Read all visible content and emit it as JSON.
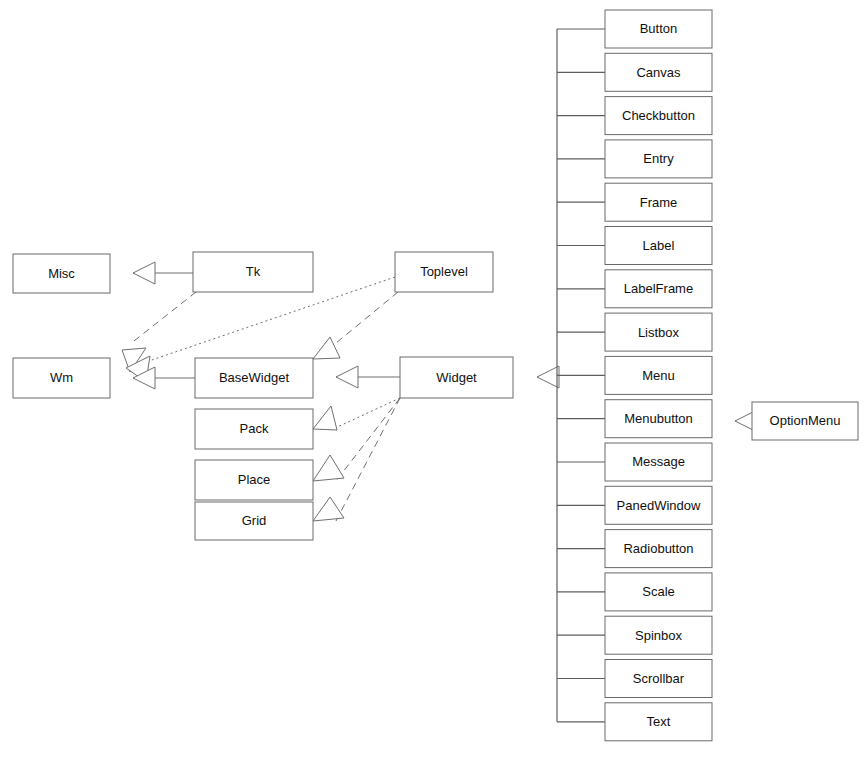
{
  "diagram": {
    "type": "uml-class-diagram",
    "background_color": "#ffffff",
    "box_fill": "#ffffff",
    "box_stroke": "#6a6a6a",
    "line_color": "#6f6f6f",
    "text_color": "#101010"
  },
  "classes": [
    {
      "id": "misc",
      "label": "Misc",
      "x": 13,
      "y": 254,
      "w": 97,
      "h": 39
    },
    {
      "id": "tk",
      "label": "Tk",
      "x": 193,
      "y": 252,
      "w": 120,
      "h": 40
    },
    {
      "id": "toplevel",
      "label": "Toplevel",
      "x": 395,
      "y": 252,
      "w": 98,
      "h": 40
    },
    {
      "id": "wm",
      "label": "Wm",
      "x": 13,
      "y": 358,
      "w": 97,
      "h": 40
    },
    {
      "id": "basewidget",
      "label": "BaseWidget",
      "x": 195,
      "y": 358,
      "w": 118,
      "h": 40
    },
    {
      "id": "widget",
      "label": "Widget",
      "x": 400,
      "y": 357,
      "w": 113,
      "h": 41
    },
    {
      "id": "pack",
      "label": "Pack",
      "x": 195,
      "y": 409,
      "w": 118,
      "h": 40
    },
    {
      "id": "place",
      "label": "Place",
      "x": 195,
      "y": 460,
      "w": 118,
      "h": 40
    },
    {
      "id": "grid",
      "label": "Grid",
      "x": 195,
      "y": 502,
      "w": 118,
      "h": 38
    },
    {
      "id": "optionmenu",
      "label": "OptionMenu",
      "x": 752,
      "y": 402,
      "w": 106,
      "h": 38
    }
  ],
  "widget_column": {
    "x": 605,
    "w": 107,
    "h": 38,
    "first_y": 10,
    "pitch": 43.3,
    "spine_x": 557,
    "items": [
      {
        "id": "button",
        "label": "Button"
      },
      {
        "id": "canvas",
        "label": "Canvas"
      },
      {
        "id": "checkbutton",
        "label": "Checkbutton"
      },
      {
        "id": "entry",
        "label": "Entry"
      },
      {
        "id": "frame",
        "label": "Frame"
      },
      {
        "id": "label",
        "label": "Label"
      },
      {
        "id": "labelframe",
        "label": "LabelFrame"
      },
      {
        "id": "listbox",
        "label": "Listbox"
      },
      {
        "id": "menu",
        "label": "Menu"
      },
      {
        "id": "menubutton",
        "label": "Menubutton"
      },
      {
        "id": "message",
        "label": "Message"
      },
      {
        "id": "panedwindow",
        "label": "PanedWindow"
      },
      {
        "id": "radiobutton",
        "label": "Radiobutton"
      },
      {
        "id": "scale",
        "label": "Scale"
      },
      {
        "id": "spinbox",
        "label": "Spinbox"
      },
      {
        "id": "scrollbar",
        "label": "Scrollbar"
      },
      {
        "id": "text",
        "label": "Text"
      }
    ]
  },
  "relations": [
    {
      "id": "tk-misc",
      "from": "Tk",
      "to": "Misc",
      "style": "solid",
      "points": [
        [
          193,
          273
        ],
        [
          133,
          273
        ]
      ],
      "head": {
        "x": 133,
        "y": 273,
        "dir": "left"
      }
    },
    {
      "id": "tk-wm",
      "from": "Tk",
      "to": "Wm",
      "style": "dashed",
      "points": [
        [
          196,
          292
        ],
        [
          134,
          341
        ]
      ],
      "head": {
        "x": 122,
        "y": 350,
        "dir": "upright"
      }
    },
    {
      "id": "toplevel-wm",
      "from": "Toplevel",
      "to": "Wm",
      "style": "dotted",
      "points": [
        [
          395,
          277
        ],
        [
          140,
          364
        ]
      ],
      "head": {
        "x": 126,
        "y": 368,
        "dir": "upright2"
      }
    },
    {
      "id": "toplevel-basewidget",
      "from": "Toplevel",
      "to": "BaseWidget",
      "style": "dashed",
      "points": [
        [
          398,
          292
        ],
        [
          330,
          348
        ]
      ],
      "head": {
        "x": 313,
        "y": 359,
        "dir": "upright3"
      }
    },
    {
      "id": "basewidget-wm",
      "from": "BaseWidget",
      "to": "Wm",
      "style": "solid",
      "points": [
        [
          195,
          378
        ],
        [
          133,
          378
        ]
      ],
      "head": {
        "x": 133,
        "y": 378,
        "dir": "left"
      }
    },
    {
      "id": "widget-basewidget",
      "from": "Widget",
      "to": "BaseWidget",
      "style": "solid",
      "points": [
        [
          400,
          377
        ],
        [
          336,
          377
        ]
      ],
      "head": {
        "x": 336,
        "y": 377,
        "dir": "left"
      }
    },
    {
      "id": "widget-pack",
      "from": "Widget",
      "to": "Pack",
      "style": "dotted",
      "points": [
        [
          400,
          398
        ],
        [
          333,
          429
        ]
      ],
      "head": {
        "x": 313,
        "y": 429,
        "dir": "down-left-1"
      }
    },
    {
      "id": "widget-place",
      "from": "Widget",
      "to": "Place",
      "style": "dashed",
      "points": [
        [
          400,
          398
        ],
        [
          336,
          481
        ]
      ],
      "head": {
        "x": 313,
        "y": 481,
        "dir": "down-left-2"
      }
    },
    {
      "id": "widget-grid",
      "from": "Widget",
      "to": "Grid",
      "style": "dashed",
      "points": [
        [
          400,
          398
        ],
        [
          336,
          521
        ]
      ],
      "head": {
        "x": 313,
        "y": 521,
        "dir": "down-left-3"
      }
    },
    {
      "id": "widgets-widget",
      "from": "widget-column",
      "to": "Widget",
      "style": "solid",
      "points": [
        [
          557,
          377
        ],
        [
          537,
          377
        ]
      ],
      "head": {
        "x": 537,
        "y": 377,
        "dir": "left"
      }
    },
    {
      "id": "optionmenu-menubutton",
      "from": "OptionMenu",
      "to": "Menubutton",
      "style": "solid",
      "points": [
        [
          752,
          421
        ],
        [
          735,
          421
        ]
      ],
      "head": {
        "x": 735,
        "y": 421,
        "dir": "left"
      }
    }
  ]
}
